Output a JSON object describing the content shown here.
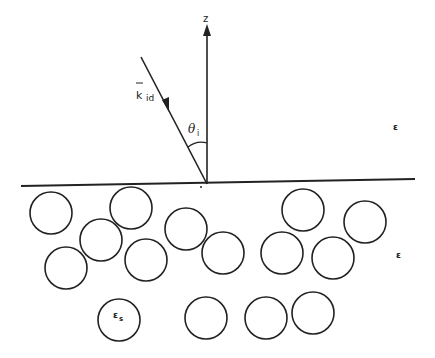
{
  "diagram": {
    "labels": {
      "z_axis": "z",
      "incident_wave": "k",
      "incident_wave_subscript": "id",
      "incidence_angle": "θ",
      "incidence_angle_subscript": "i",
      "upper_medium": "ε",
      "lower_medium": "ε",
      "scatterer_permittivity": "ε",
      "scatterer_permittivity_subscript": "s"
    },
    "scatterer_count": 15,
    "colors": {
      "stroke": "#222222",
      "background": "#ffffff"
    }
  }
}
